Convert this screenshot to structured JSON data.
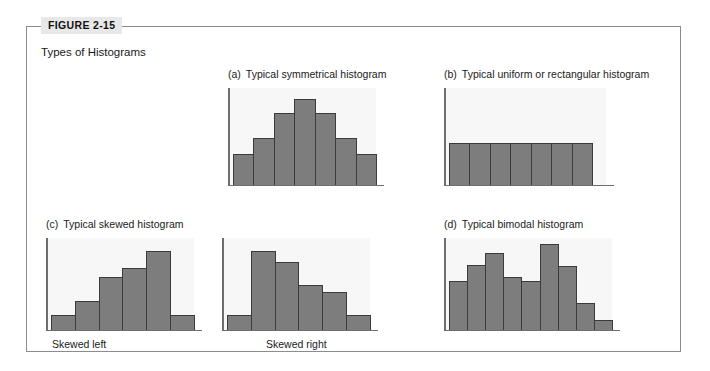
{
  "figure": {
    "tag": "FIGURE 2-15",
    "subtitle": "Types of Histograms"
  },
  "colors": {
    "bar_fill": "#7d7d7d",
    "bar_stroke": "#3b3b3b",
    "plot_bg": "#f7f7f7",
    "frame": "#8b8b93",
    "tag_bg": "#e8e8e8",
    "text": "#1a1a1a"
  },
  "panels": [
    {
      "letter": "(a)",
      "caption": "Typical symmetrical histogram",
      "axis_label": ""
    },
    {
      "letter": "(b)",
      "caption": "Typical uniform or rectangular histogram",
      "axis_label": ""
    },
    {
      "letter": "(c)",
      "caption": "Typical skewed histogram",
      "axis_label_left": "Skewed left",
      "axis_label_right": "Skewed right"
    },
    {
      "letter": "(d)",
      "caption": "Typical bimodal histogram",
      "axis_label": ""
    }
  ],
  "chart_data": [
    {
      "type": "bar",
      "title": "(a) Typical symmetrical histogram",
      "categories": [
        "1",
        "2",
        "3",
        "4",
        "5",
        "6",
        "7"
      ],
      "values": [
        2.2,
        3.4,
        5.2,
        6.2,
        5.2,
        3.4,
        2.2
      ],
      "xlabel": "",
      "ylabel": "",
      "ylim": [
        0,
        7
      ],
      "grid": false,
      "legend": "none"
    },
    {
      "type": "bar",
      "title": "(b) Typical uniform or rectangular histogram",
      "categories": [
        "1",
        "2",
        "3",
        "4",
        "5",
        "6",
        "7"
      ],
      "values": [
        3,
        3,
        3,
        3,
        3,
        3,
        3
      ],
      "xlabel": "",
      "ylabel": "",
      "ylim": [
        0,
        7
      ],
      "grid": false,
      "legend": "none"
    },
    {
      "type": "bar",
      "title": "(c) Typical skewed histogram - Skewed left",
      "categories": [
        "1",
        "2",
        "3",
        "4",
        "5",
        "6"
      ],
      "values": [
        1.1,
        2.2,
        4.0,
        4.7,
        6.0,
        1.1
      ],
      "xlabel": "Skewed left",
      "ylabel": "",
      "ylim": [
        0,
        7
      ],
      "grid": false,
      "legend": "none"
    },
    {
      "type": "bar",
      "title": "(c) Typical skewed histogram - Skewed right",
      "categories": [
        "1",
        "2",
        "3",
        "4",
        "5",
        "6"
      ],
      "values": [
        1.1,
        6.0,
        5.2,
        3.4,
        2.9,
        1.1
      ],
      "xlabel": "Skewed right",
      "ylabel": "",
      "ylim": [
        0,
        7
      ],
      "grid": false,
      "legend": "none"
    },
    {
      "type": "bar",
      "title": "(d) Typical bimodal histogram",
      "categories": [
        "1",
        "2",
        "3",
        "4",
        "5",
        "6",
        "7",
        "8",
        "9"
      ],
      "values": [
        4.0,
        5.3,
        6.3,
        4.3,
        4.0,
        7.0,
        5.2,
        2.2,
        0.8
      ],
      "xlabel": "",
      "ylabel": "",
      "ylim": [
        0,
        7.5
      ],
      "grid": false,
      "legend": "none"
    }
  ]
}
